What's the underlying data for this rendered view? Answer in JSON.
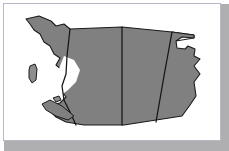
{
  "figure": {
    "kind": "map",
    "region": "Western Canada",
    "projection_note": "plan view, north at top",
    "frame": {
      "border_color": "#b9b9c6",
      "background_color": "#ffffff",
      "shadow_color": "#6e6e72"
    },
    "palette": {
      "land_fill": "#808080",
      "land_fill_light": "#8d8d8d",
      "water_fill": "#ffffff",
      "outline": "#1a1a1a",
      "border_line": "#141414"
    }
  },
  "map": {
    "landmass_name": "western-canada-landmass",
    "provinces": [
      {
        "id": "bc",
        "name": "British Columbia",
        "label": "",
        "fill": "#808080"
      },
      {
        "id": "ab",
        "name": "Alberta",
        "label": "",
        "fill": "#808080"
      },
      {
        "id": "sk",
        "name": "Saskatchewan",
        "label": "",
        "fill": "#808080"
      },
      {
        "id": "mb",
        "name": "Manitoba",
        "label": "",
        "fill": "#808080"
      }
    ],
    "islands": [
      {
        "id": "haida-gwaii",
        "name": "Haida Gwaii",
        "label": ""
      },
      {
        "id": "vancouver-island",
        "name": "Vancouver Island",
        "label": ""
      },
      {
        "id": "coastal-islet",
        "name": "Coastal islet",
        "label": ""
      }
    ],
    "features": [
      {
        "id": "pacific-coastline",
        "name": "Pacific coastline",
        "label": ""
      },
      {
        "id": "northern-boundary",
        "name": "60th parallel northern boundary",
        "label": ""
      },
      {
        "id": "southern-boundary",
        "name": "49th parallel southern boundary",
        "label": ""
      },
      {
        "id": "manitoba-notch",
        "name": "Manitoba eastern notch",
        "label": ""
      }
    ],
    "geometry": {
      "viewbox": "0 0 216 136",
      "landmass_path": "M 22,15 L 35,12 L 47,17 L 52,22 L 60,20 L 66,25 L 118,23 L 168,28 L 190,31 L 190,34 L 178,33 L 172,37 L 173,44 L 181,45 L 184,42 L 191,45 L 190,52 L 196,55 L 190,62 L 196,70 L 190,78 L 192,92 L 186,101 L 178,112 L 120,121 L 80,121 L 62,118 L 52,113 L 46,107 L 48,101 L 56,99 L 62,93 L 57,86 L 60,78 L 54,72 L 58,66 L 52,61 L 56,54 L 50,50 L 46,42 L 40,38 L 36,30 L 30,26 L 26,20 Z",
      "bc_ab_border": "M 66,25 L 63,52 L 62,70 L 58,82 L 60,96 L 66,108 L 72,121",
      "ab_sk_border": "M 118,23 L 118,72 L 118,121",
      "sk_mb_border": "M 168,28 L 160,72 L 152,118",
      "north_sliver": "M 168,28 L 190,31 L 190,34 L 172,37 L 166,33 Z",
      "haida_gwaii": "M 26,62 L 31,60 L 33,65 L 32,76 L 28,79 L 25,74 L 25,66 Z",
      "vancouver_island": "M 38,100 L 46,96 L 58,102 L 70,112 L 64,116 L 52,112 L 42,106 Z",
      "coastal_islet": "M 49,94 L 55,92 L 57,96 L 52,98 Z",
      "inland_water": "M 60,52 L 70,56 L 76,66 L 72,78 L 64,86 L 56,92 L 50,86 L 52,74 L 56,62 Z"
    }
  },
  "a11y": {
    "figure_role": "image",
    "alt_text": "Grayscale outline map of the four western Canadian provinces with province borders and Pacific coastal islands"
  }
}
